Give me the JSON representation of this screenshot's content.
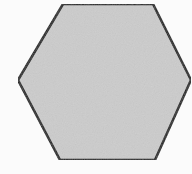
{
  "figure": {
    "shape": "hexagon",
    "fill_color": "#cccccc",
    "stroke_color": "#1a1a1a",
    "background_color": "#fbfbfb",
    "vertices": [
      [
        63,
        4
      ],
      [
        153,
        4
      ],
      [
        191,
        80
      ],
      [
        155,
        160
      ],
      [
        60,
        160
      ],
      [
        18,
        80
      ]
    ]
  }
}
